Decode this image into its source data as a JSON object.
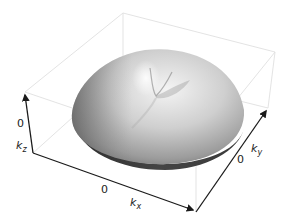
{
  "figure": {
    "axes": {
      "kx": {
        "symbol": "k",
        "subscript": "x",
        "tick": "0"
      },
      "ky": {
        "symbol": "k",
        "subscript": "y",
        "tick": "0"
      },
      "kz": {
        "symbol": "k",
        "subscript": "z",
        "tick": "0"
      }
    },
    "colors": {
      "axis": "#1a1a1a",
      "box": "#e2e2e2",
      "surface_light": "#f2f2f2",
      "surface_mid": "#b8b8b8",
      "surface_dark": "#5a5a5a"
    }
  }
}
